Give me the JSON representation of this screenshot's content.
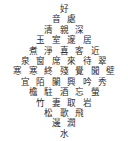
{
  "page": {
    "background_color": "#ffffff",
    "text_color": "#2b2b2b",
    "shape": "diamond"
  },
  "poem": {
    "rows": [
      {
        "line_index": 1,
        "chars": [
          "好"
        ]
      },
      {
        "line_index": 2,
        "chars": [
          "音",
          "處"
        ]
      },
      {
        "line_index": 3,
        "chars": [
          "清",
          "親",
          "深"
        ]
      },
      {
        "line_index": 4,
        "chars": [
          "玉",
          "室",
          "邃",
          "居"
        ]
      },
      {
        "line_index": 5,
        "chars": [
          "煮",
          "淨",
          "喜",
          "客",
          "近"
        ]
      },
      {
        "line_index": 6,
        "chars": [
          "泉",
          "窗",
          "席",
          "來",
          "待",
          "翠"
        ]
      },
      {
        "line_index": 7,
        "chars": [
          "寒",
          "寒",
          "終",
          "殘",
          "覺",
          "聞",
          "壁"
        ]
      },
      {
        "line_index": 8,
        "chars": [
          "宜",
          "陌",
          "闌",
          "興",
          "吟",
          "秀"
        ]
      },
      {
        "line_index": 9,
        "chars": [
          "檐",
          "駐",
          "酒",
          "忘",
          "螢"
        ]
      },
      {
        "line_index": 10,
        "chars": [
          "竹",
          "妻",
          "取",
          "岩"
        ]
      },
      {
        "line_index": 11,
        "chars": [
          "松",
          "歌",
          "飛"
        ]
      },
      {
        "line_index": 12,
        "chars": [
          "邊",
          "潤"
        ]
      },
      {
        "line_index": 13,
        "chars": [
          "水"
        ]
      }
    ]
  }
}
